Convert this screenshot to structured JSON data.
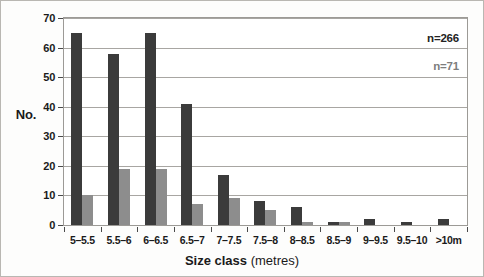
{
  "chart_data": {
    "type": "bar",
    "title": "",
    "subtitle": "",
    "xlabel_bold": "Size class",
    "xlabel_regular": "(metres)",
    "ylabel": "No.",
    "ylim": [
      0,
      70
    ],
    "ytick_step": 10,
    "yticks": [
      0,
      10,
      20,
      30,
      40,
      50,
      60,
      70
    ],
    "ytick_labels": [
      "0",
      "10",
      "20",
      "30",
      "40",
      "50",
      "60",
      "70"
    ],
    "grid": "horizontal",
    "legend_position": "none",
    "categories": [
      "5–5.5",
      "5.5–6",
      "6–6.5",
      "6.5–7",
      "7–7.5",
      "7.5–8",
      "8–8.5",
      "8.5–9",
      "9–9.5",
      "9.5–10",
      ">10m"
    ],
    "series": [
      {
        "name": "n=266",
        "color": "#3b3b3b",
        "values": [
          65,
          58,
          65,
          41,
          17,
          8,
          6,
          1,
          2,
          1,
          2
        ]
      },
      {
        "name": "n=71",
        "color": "#8d8d8d",
        "values": [
          10,
          19,
          19,
          7,
          9,
          5,
          1,
          1,
          0,
          0,
          0
        ]
      }
    ],
    "annotations": [
      {
        "text": "n=266",
        "color": "#232323"
      },
      {
        "text": "n=71",
        "color": "#7d7d7d"
      }
    ]
  }
}
